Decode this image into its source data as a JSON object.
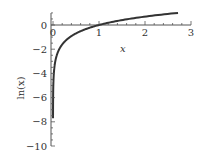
{
  "chart_data": {
    "type": "line",
    "title": "",
    "xlabel": "x",
    "ylabel": "ln(x)",
    "xlim": [
      0,
      3
    ],
    "ylim": [
      -10,
      1
    ],
    "xticks": [
      0,
      1,
      2,
      3
    ],
    "xtick_labels": [
      "0",
      "1",
      "2",
      "3"
    ],
    "yticks": [
      0,
      -2,
      -4,
      -6,
      -8,
      -10
    ],
    "ytick_labels": [
      "0",
      "−2",
      "−4",
      "−6",
      "−8",
      "−10"
    ],
    "grid": false,
    "legend": null,
    "series": [
      {
        "name": "ln(x)",
        "x": [
          0.00045,
          0.002,
          0.01,
          0.03,
          0.05,
          0.1,
          0.2,
          0.3,
          0.5,
          0.75,
          1.0,
          1.5,
          2.0,
          2.5,
          2.718
        ],
        "values": [
          -7.7,
          -6.21,
          -4.61,
          -3.51,
          -3.0,
          -2.3,
          -1.61,
          -1.2,
          -0.69,
          -0.29,
          0.0,
          0.41,
          0.69,
          0.92,
          1.0
        ]
      }
    ],
    "color": "#333333"
  }
}
